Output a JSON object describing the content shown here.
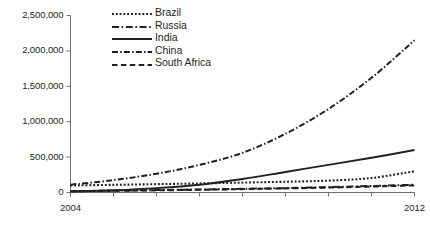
{
  "chart_data": {
    "type": "line",
    "title": "",
    "xlabel": "",
    "ylabel": "",
    "x": [
      2004,
      2005,
      2006,
      2007,
      2008,
      2009,
      2010,
      2011,
      2012
    ],
    "xlim": [
      2004,
      2012
    ],
    "ylim": [
      0,
      2500000
    ],
    "grid": false,
    "legend_position": "top-left inside plot",
    "xtick_labels": [
      "2004",
      "2012"
    ],
    "xtick_values": [
      2004,
      2005,
      2006,
      2007,
      2008,
      2009,
      2010,
      2011,
      2012
    ],
    "ytick_labels": [
      "0",
      "500,000",
      "1,000,000",
      "1,500,000",
      "2,000,000",
      "2,500,000"
    ],
    "ytick_values": [
      0,
      500000,
      1000000,
      1500000,
      2000000,
      2500000
    ],
    "series": [
      {
        "name": "Brazil",
        "dash": "dotted",
        "color": "#231f20",
        "values": [
          100000,
          108000,
          118000,
          128000,
          140000,
          152000,
          168000,
          205000,
          300000
        ]
      },
      {
        "name": "Russia",
        "dash": "dash-dot",
        "color": "#231f20",
        "values": [
          20000,
          26000,
          34000,
          42000,
          52000,
          62000,
          76000,
          92000,
          110000
        ]
      },
      {
        "name": "India",
        "dash": "solid",
        "color": "#231f20",
        "values": [
          15000,
          32000,
          62000,
          110000,
          190000,
          290000,
          390000,
          490000,
          600000
        ]
      },
      {
        "name": "China",
        "dash": "dash-dot-dash",
        "color": "#231f20",
        "values": [
          110000,
          175000,
          265000,
          390000,
          560000,
          830000,
          1180000,
          1620000,
          2150000
        ]
      },
      {
        "name": "South Africa",
        "dash": "dashed",
        "color": "#231f20",
        "values": [
          18000,
          24000,
          31000,
          39000,
          48000,
          58000,
          70000,
          84000,
          100000
        ]
      }
    ]
  },
  "axis": {
    "line_color": "#6d6e71",
    "tick_color": "#6d6e71"
  }
}
